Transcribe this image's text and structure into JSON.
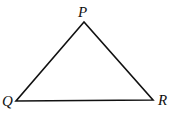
{
  "diagram": {
    "type": "triangle",
    "vertices": [
      {
        "label": "P",
        "x": 84,
        "y": 22
      },
      {
        "label": "Q",
        "x": 16,
        "y": 101
      },
      {
        "label": "R",
        "x": 153,
        "y": 100
      }
    ],
    "stroke_color": "#111111"
  }
}
